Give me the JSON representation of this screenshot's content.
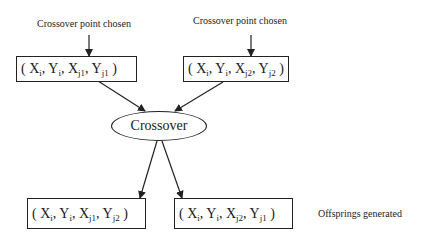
{
  "diagram": {
    "annotations": {
      "top_left": "Crossover point chosen",
      "top_right": "Crossover point chosen",
      "bottom_right": "Offsprings generated"
    },
    "parents": [
      {
        "terms": [
          {
            "v": "X",
            "s": "i"
          },
          {
            "v": "Y",
            "s": "i"
          },
          {
            "v": "X",
            "s": "j1"
          },
          {
            "v": "Y",
            "s": "j1"
          }
        ]
      },
      {
        "terms": [
          {
            "v": "X",
            "s": "i"
          },
          {
            "v": "Y",
            "s": "i"
          },
          {
            "v": "X",
            "s": "j2"
          },
          {
            "v": "Y",
            "s": "j2"
          }
        ]
      }
    ],
    "operator": "Crossover",
    "offspring": [
      {
        "terms": [
          {
            "v": "X",
            "s": "i"
          },
          {
            "v": "Y",
            "s": "i"
          },
          {
            "v": "X",
            "s": "j1"
          },
          {
            "v": "Y",
            "s": "j2"
          }
        ]
      },
      {
        "terms": [
          {
            "v": "X",
            "s": "i"
          },
          {
            "v": "Y",
            "s": "i"
          },
          {
            "v": "X",
            "s": "j2"
          },
          {
            "v": "Y",
            "s": "j1"
          }
        ]
      }
    ],
    "punct": {
      "open": "( ",
      "sep": ", ",
      "close": " )"
    }
  }
}
